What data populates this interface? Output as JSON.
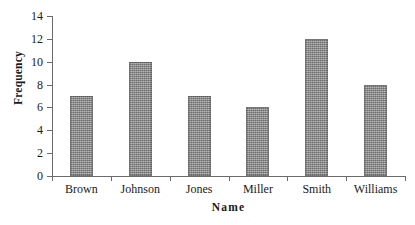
{
  "chart_data": {
    "type": "bar",
    "title": "",
    "xlabel": "Name",
    "ylabel": "Frequency",
    "categories": [
      "Brown",
      "Johnson",
      "Jones",
      "Miller",
      "Smith",
      "Williams"
    ],
    "values": [
      7,
      10,
      7,
      6,
      12,
      8
    ],
    "ylim": [
      0,
      14
    ],
    "ytick_step": 2,
    "yticks": [
      0,
      2,
      4,
      6,
      8,
      10,
      12,
      14
    ],
    "ytick_labels": [
      "0",
      "2",
      "4",
      "6",
      "8",
      "10",
      "12",
      "14"
    ],
    "grid": false,
    "legend": null,
    "bar_color": "#8a8a8a",
    "axis_color": "#6b6b6b",
    "background_color": "#ffffff"
  }
}
